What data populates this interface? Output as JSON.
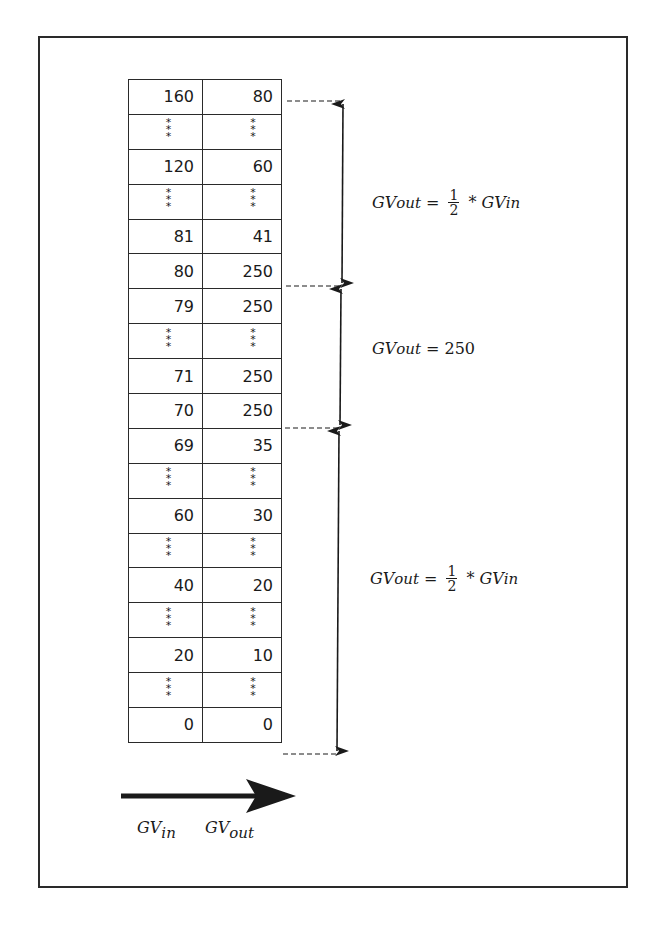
{
  "diagram": {
    "type": "lookup-table-mapping",
    "columns": [
      "GV_in",
      "GV_out"
    ],
    "rows": [
      {
        "in": "160",
        "out": "80"
      },
      {
        "in": "***",
        "out": "***"
      },
      {
        "in": "120",
        "out": "60"
      },
      {
        "in": "***",
        "out": "***"
      },
      {
        "in": "81",
        "out": "41"
      },
      {
        "in": "80",
        "out": "250"
      },
      {
        "in": "79",
        "out": "250"
      },
      {
        "in": "***",
        "out": "***"
      },
      {
        "in": "71",
        "out": "250"
      },
      {
        "in": "70",
        "out": "250"
      },
      {
        "in": "69",
        "out": "35"
      },
      {
        "in": "***",
        "out": "***"
      },
      {
        "in": "60",
        "out": "30"
      },
      {
        "in": "***",
        "out": "***"
      },
      {
        "in": "40",
        "out": "20"
      },
      {
        "in": "***",
        "out": "***"
      },
      {
        "in": "20",
        "out": "10"
      },
      {
        "in": "***",
        "out": "***"
      },
      {
        "in": "0",
        "out": "0"
      }
    ],
    "regions": [
      {
        "range": "80 to 160",
        "lhs_base": "GV",
        "lhs_sub": "out",
        "eq": "=",
        "frac_num": "1",
        "frac_den": "2",
        "op": "*",
        "rhs_base": "GV",
        "rhs_sub": "in"
      },
      {
        "range": "70 to 80",
        "lhs_base": "GV",
        "lhs_sub": "out",
        "eq": "=",
        "value": "250"
      },
      {
        "range": "0 to 70",
        "lhs_base": "GV",
        "lhs_sub": "out",
        "eq": "=",
        "frac_num": "1",
        "frac_den": "2",
        "op": "*",
        "rhs_base": "GV",
        "rhs_sub": "in"
      }
    ],
    "axis": {
      "in_base": "GV",
      "in_sub": "in",
      "out_base": "GV",
      "out_sub": "out"
    },
    "colors": {
      "ink": "#1a1a1a",
      "background": "#ffffff"
    }
  }
}
